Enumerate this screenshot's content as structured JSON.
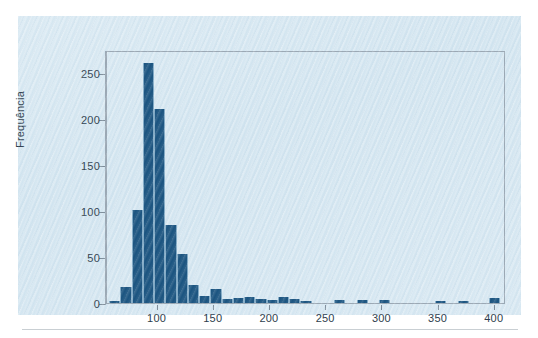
{
  "chart_data": {
    "type": "bar",
    "title": "",
    "subtitle": "",
    "xlabel": "",
    "ylabel": "Frequência",
    "grid": false,
    "legend": null,
    "xlim": [
      55,
      410
    ],
    "ylim": [
      0,
      275
    ],
    "bin_width": 10,
    "y_ticks": [
      0,
      50,
      100,
      150,
      200,
      250
    ],
    "y_tick_labels": [
      "0",
      "50",
      "100",
      "150",
      "200",
      "250"
    ],
    "x_ticks": [
      100,
      150,
      200,
      250,
      300,
      350,
      400
    ],
    "x_tick_labels": [
      "100",
      "150",
      "200",
      "250",
      "300",
      "350",
      "400"
    ],
    "bar_color": "#1b5480",
    "bar_edge_color": "#7fa8c4",
    "panel_color": "#d2e5f0",
    "axis_color": "#9aa7b3",
    "bins": [
      {
        "x0": 57,
        "x1": 67,
        "value": 2
      },
      {
        "x0": 67,
        "x1": 77,
        "value": 17
      },
      {
        "x0": 77,
        "x1": 87,
        "value": 101
      },
      {
        "x0": 87,
        "x1": 97,
        "value": 261
      },
      {
        "x0": 97,
        "x1": 107,
        "value": 211
      },
      {
        "x0": 107,
        "x1": 117,
        "value": 85
      },
      {
        "x0": 117,
        "x1": 127,
        "value": 53
      },
      {
        "x0": 127,
        "x1": 137,
        "value": 20
      },
      {
        "x0": 137,
        "x1": 147,
        "value": 8
      },
      {
        "x0": 147,
        "x1": 157,
        "value": 15
      },
      {
        "x0": 157,
        "x1": 167,
        "value": 4
      },
      {
        "x0": 167,
        "x1": 177,
        "value": 5
      },
      {
        "x0": 177,
        "x1": 187,
        "value": 7
      },
      {
        "x0": 187,
        "x1": 197,
        "value": 4
      },
      {
        "x0": 197,
        "x1": 207,
        "value": 3
      },
      {
        "x0": 207,
        "x1": 217,
        "value": 6
      },
      {
        "x0": 217,
        "x1": 227,
        "value": 4
      },
      {
        "x0": 227,
        "x1": 237,
        "value": 2
      },
      {
        "x0": 257,
        "x1": 267,
        "value": 3
      },
      {
        "x0": 277,
        "x1": 287,
        "value": 3
      },
      {
        "x0": 297,
        "x1": 307,
        "value": 3
      },
      {
        "x0": 347,
        "x1": 357,
        "value": 2
      },
      {
        "x0": 367,
        "x1": 377,
        "value": 2
      },
      {
        "x0": 395,
        "x1": 405,
        "value": 5
      }
    ]
  }
}
